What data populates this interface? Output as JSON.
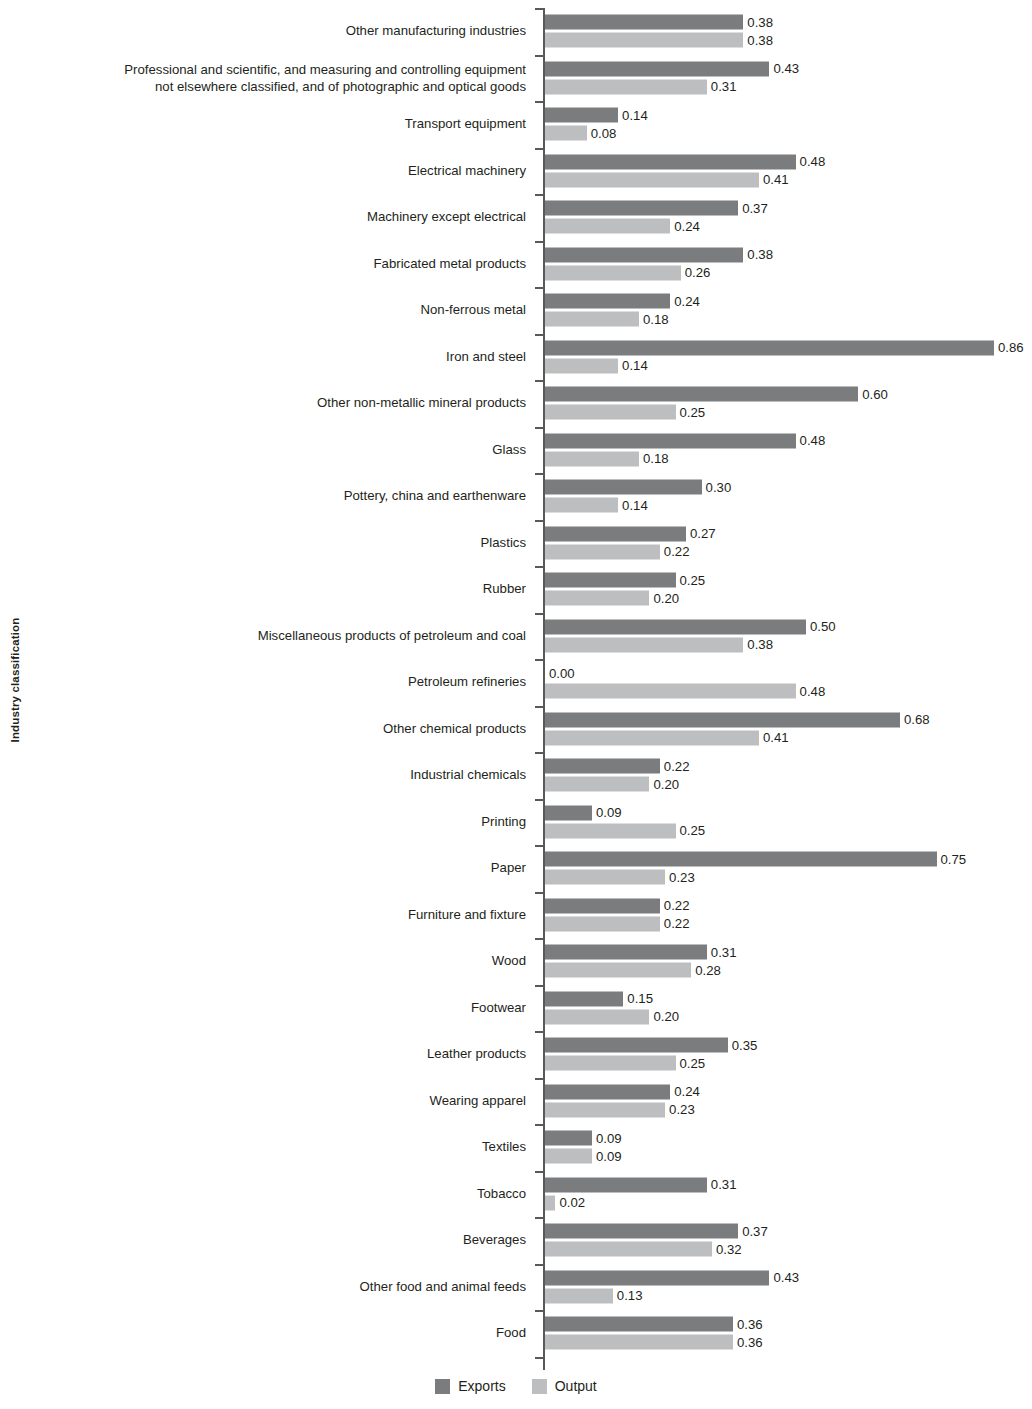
{
  "chart_data": {
    "type": "bar",
    "orientation": "horizontal",
    "title": "",
    "xlabel": "",
    "ylabel": "Industry classification",
    "xlim": [
      0,
      0.9
    ],
    "grid": false,
    "legend_position": "bottom-center",
    "colors": {
      "exports": "#7b7c7e",
      "output": "#bdbec0",
      "axis": "#58595b",
      "text": "#231f20"
    },
    "value_format": "0.00",
    "categories": [
      "Other manufacturing industries",
      "Professional and scientific, and measuring and controlling equipment\nnot elsewhere classified, and of photographic and optical goods",
      "Transport equipment",
      "Electrical machinery",
      "Machinery except electrical",
      "Fabricated metal products",
      "Non-ferrous metal",
      "Iron and steel",
      "Other non-metallic mineral products",
      "Glass",
      "Pottery, china and earthenware",
      "Plastics",
      "Rubber",
      "Miscellaneous products of petroleum and coal",
      "Petroleum refineries",
      "Other chemical products",
      "Industrial chemicals",
      "Printing",
      "Paper",
      "Furniture and fixture",
      "Wood",
      "Footwear",
      "Leather products",
      "Wearing apparel",
      "Textiles",
      "Tobacco",
      "Beverages",
      "Other food and animal feeds",
      "Food"
    ],
    "series": [
      {
        "name": "Exports",
        "values": [
          0.38,
          0.43,
          0.14,
          0.48,
          0.37,
          0.38,
          0.24,
          0.86,
          0.6,
          0.48,
          0.3,
          0.27,
          0.25,
          0.5,
          0.0,
          0.68,
          0.22,
          0.09,
          0.75,
          0.22,
          0.31,
          0.15,
          0.35,
          0.24,
          0.09,
          0.31,
          0.37,
          0.43,
          0.36
        ],
        "labels": [
          "0.38",
          "0.43",
          "0.14",
          "0.48",
          "0.37",
          "0.38",
          "0.24",
          "0.86",
          "0.60",
          "0.48",
          "0.30",
          "0.27",
          "0.25",
          "0.50",
          "0.00",
          "0.68",
          "0.22",
          "0.09",
          "0.75",
          "0.22",
          "0.31",
          "0.15",
          "0.35",
          "0.24",
          "0.09",
          "0.31",
          "0.37",
          "0.43",
          "0.36"
        ]
      },
      {
        "name": "Output",
        "values": [
          0.38,
          0.31,
          0.08,
          0.41,
          0.24,
          0.26,
          0.18,
          0.14,
          0.25,
          0.18,
          0.14,
          0.22,
          0.2,
          0.38,
          0.48,
          0.41,
          0.2,
          0.25,
          0.23,
          0.22,
          0.28,
          0.2,
          0.25,
          0.23,
          0.09,
          0.02,
          0.32,
          0.13,
          0.36
        ],
        "labels": [
          "0.38",
          "0.31",
          "0.08",
          "0.41",
          "0.24",
          "0.26",
          "0.18",
          "0.14",
          "0.25",
          "0.18",
          "0.14",
          "0.22",
          "0.20",
          "0.38",
          "0.48",
          "0.41",
          "0.20",
          "0.25",
          "0.23",
          "0.22",
          "0.28",
          "0.20",
          "0.25",
          "0.23",
          "0.09",
          "0.02",
          "0.32",
          "0.13",
          "0.36"
        ]
      }
    ]
  },
  "axis": {
    "y_title": "Industry classification"
  },
  "legend": {
    "items": [
      {
        "label": "Exports",
        "key": "exports"
      },
      {
        "label": "Output",
        "key": "output"
      }
    ]
  }
}
